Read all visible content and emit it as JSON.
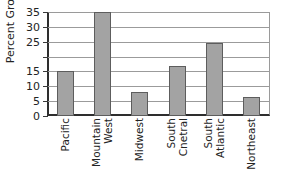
{
  "chart_data": {
    "type": "bar",
    "title": "",
    "xlabel": "",
    "ylabel": "Percent Growth",
    "categories": [
      "Pacific",
      "Mountain West",
      "Midwest",
      "South Cnetral",
      "South Atlantic",
      "Northeast"
    ],
    "category_lines": [
      [
        "Pacific"
      ],
      [
        "Mountain",
        "West"
      ],
      [
        "Midwest"
      ],
      [
        "South",
        "Cnetral"
      ],
      [
        "South",
        "Atlantic"
      ],
      [
        "Northeast"
      ]
    ],
    "values": [
      15,
      35,
      8,
      17,
      24.7,
      6.5
    ],
    "ylim": [
      0,
      35
    ],
    "yticks": [
      0,
      5,
      10,
      15,
      20,
      25,
      30,
      35
    ],
    "ytick_labels": [
      "0",
      "5",
      "10",
      "15",
      "",
      "25",
      "30",
      "35"
    ],
    "grid": true,
    "legend": "none",
    "bar_color": "#a3a3a3",
    "bar_edge_color": "#5d5d5d",
    "axis_color": "#2e2e2e",
    "grid_color": "#9b9b9b"
  }
}
